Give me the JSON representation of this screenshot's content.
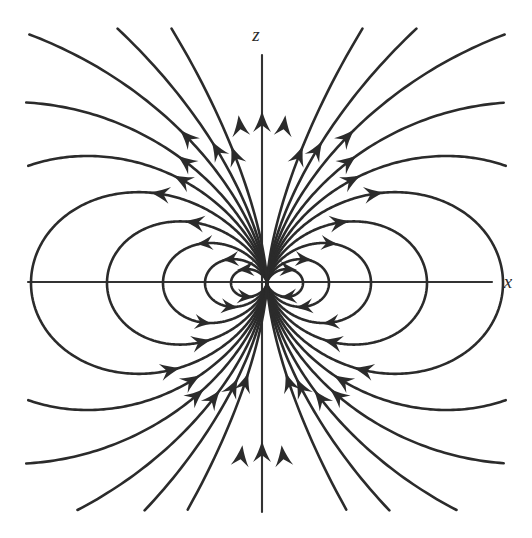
{
  "figure": {
    "background_color": "#ffffff",
    "stroke_color": "#2b2b2b",
    "axis_color": "#333333",
    "width": 532,
    "height": 538
  },
  "axes": {
    "z_label": "z",
    "x_label": "x",
    "z_label_position": {
      "x": 256,
      "y": 41
    },
    "x_label_position": {
      "x": 508,
      "y": 288
    },
    "origin": {
      "x": 267,
      "y": 283
    },
    "x_axis": {
      "x1": 28,
      "y1": 282,
      "x2": 492,
      "y2": 282
    },
    "z_axis": {
      "x1": 262,
      "y1": 55,
      "x2": 262,
      "y2": 512
    }
  },
  "chart_data": {
    "type": "line",
    "xlabel": "x",
    "ylabel": "z",
    "grid": false,
    "legend": null,
    "origin": {
      "x": 267,
      "y": 283
    },
    "field_line_family": {
      "equation": "r = R * sin(theta)^2",
      "theta_measured_from": "+z axis",
      "R_values": [
        36,
        62,
        104,
        160,
        236,
        330,
        470,
        720,
        1150,
        2200
      ],
      "closed_loop_count_per_side": 3,
      "open_line_count_per_side": 7
    },
    "arrow_direction_by_quadrant": {
      "upper_left": "up-and-left (outward from origin)",
      "upper_right": "up-and-right then up-and-left (outward from origin)",
      "lower_left": "up-and-right (inward toward origin)",
      "lower_right": "up-and-left (inward toward origin)",
      "z_axis_top": "upward",
      "z_axis_bottom": "upward"
    },
    "loop_extents": {
      "outer_loop_right_x": 472,
      "outer_loop_left_x": 44,
      "outer_loop_top_y": 196,
      "outer_loop_bottom_y": 370
    }
  }
}
